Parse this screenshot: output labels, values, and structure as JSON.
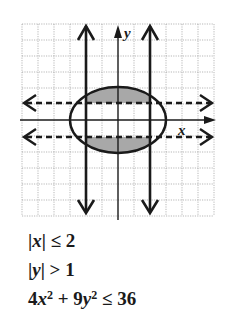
{
  "graph": {
    "axis_labels": {
      "x": "x",
      "y": "y"
    },
    "grid": {
      "min": -6,
      "max": 6,
      "unit_px": 16,
      "origin_px": [
        118,
        120
      ]
    },
    "colors": {
      "ink": "#1a1a1a",
      "grid": "#9a9a9a",
      "shade": "#a8a8a8",
      "background": "#ffffff"
    },
    "boundaries": [
      {
        "name": "vertical-line-x-neg2",
        "equation": "x = -2",
        "style": "solid"
      },
      {
        "name": "vertical-line-x-pos2",
        "equation": "x = 2",
        "style": "solid"
      },
      {
        "name": "horizontal-line-y-pos1",
        "equation": "y = 1",
        "style": "dashed"
      },
      {
        "name": "horizontal-line-y-neg1",
        "equation": "y = -1",
        "style": "dashed"
      },
      {
        "name": "ellipse",
        "equation": "4x^2 + 9y^2 = 36",
        "style": "solid",
        "semi_axes": [
          3,
          2
        ]
      }
    ],
    "shaded_regions": [
      "upper cap: -2<=x<=2, 1<y, inside ellipse",
      "lower cap: -2<=x<=2, y<-1, inside ellipse"
    ]
  },
  "inequalities": [
    {
      "lhs_parts": [
        "|",
        "x",
        "|"
      ],
      "op": "≤",
      "rhs": "2"
    },
    {
      "lhs_parts": [
        "|",
        "y",
        "|"
      ],
      "op": ">",
      "rhs": "1"
    },
    {
      "text": "4x² + 9y² ≤ 36"
    }
  ],
  "ineq_text": {
    "abs_bar": "|",
    "x": "x",
    "y": "y",
    "le": "≤",
    "gt": ">",
    "two": "2",
    "one": "1",
    "four": "4",
    "nine": "9",
    "sq": "2",
    "plus": "+",
    "thirty_six": "36"
  }
}
